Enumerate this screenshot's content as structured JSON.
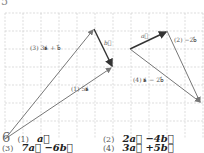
{
  "header": {
    "problem_number": "5"
  },
  "figure": {
    "grid": {
      "x0": 5,
      "y0": 13,
      "spacing": 18,
      "color": "#c8c8c8"
    },
    "left": {
      "labels": {
        "b": "b⃗",
        "item3": "(3) 3a⃗ + b⃗",
        "item1": "(1) 5a⃗"
      }
    },
    "right": {
      "labels": {
        "a": "a⃗",
        "item2": "(2) −2b⃗",
        "item4": "(4) a⃗ − 2b⃗"
      }
    },
    "colors": {
      "given_vector": "#333333",
      "result_vector": "#777777"
    }
  },
  "answers": {
    "problem_number": "6",
    "items": [
      {
        "index": "(1)",
        "expr": "a⃗"
      },
      {
        "index": "(2)",
        "expr": "2a⃗ −4b⃗"
      },
      {
        "index": "(3)",
        "expr": "7a⃗ −6b⃗"
      },
      {
        "index": "(4)",
        "expr": "3a⃗ +5b⃗"
      }
    ]
  }
}
